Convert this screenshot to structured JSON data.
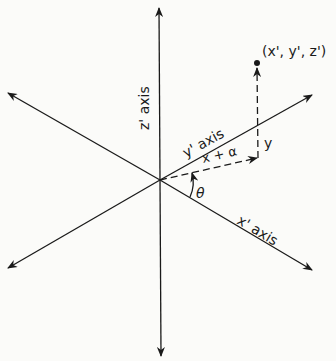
{
  "diagram": {
    "z_axis_label": "z' axis",
    "y_axis_label": "y' axis",
    "x_axis_label": "x' axis",
    "point_label": "(x', y', z')",
    "dashed_label": "x + α",
    "y_label": "y",
    "angle_label": "θ",
    "line_color": "#1a1a1a",
    "background": "#fbfbf9"
  }
}
